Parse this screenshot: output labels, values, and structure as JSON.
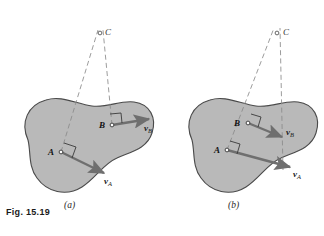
{
  "figure": {
    "caption": "Fig. 15.19",
    "panels": [
      {
        "id": "a",
        "sublabel": "(a)",
        "instant_center_label": "C",
        "points": [
          {
            "label": "A",
            "x": 61,
            "y": 152
          },
          {
            "label": "B",
            "x": 112,
            "y": 125
          },
          {
            "label": "C",
            "x": 100,
            "y": 33
          }
        ],
        "vectors": [
          {
            "name": "v_A",
            "label_v": "v",
            "label_sub": "A",
            "from": [
              61,
              152
            ],
            "to": [
              106,
              174
            ]
          },
          {
            "name": "v_B",
            "label_v": "v",
            "label_sub": "B",
            "from": [
              112,
              125
            ],
            "to": [
              152,
              118
            ]
          }
        ]
      },
      {
        "id": "b",
        "sublabel": "(b)",
        "instant_center_label": "C",
        "points": [
          {
            "label": "A",
            "x": 227,
            "y": 150
          },
          {
            "label": "B",
            "x": 248,
            "y": 123
          },
          {
            "label": "C",
            "x": 277,
            "y": 33
          }
        ],
        "vectors": [
          {
            "name": "v_A",
            "label_v": "v",
            "label_sub": "A",
            "from": [
              227,
              150
            ],
            "to": [
              292,
              168
            ]
          },
          {
            "name": "v_B",
            "label_v": "v",
            "label_sub": "B",
            "from": [
              248,
              123
            ],
            "to": [
              284,
              138
            ]
          }
        ]
      }
    ],
    "colors": {
      "body_fill": "#b9b9b9",
      "body_stroke": "#4a4a4a",
      "vector": "#6f6f6f",
      "dashed_line": "#8a8a8a",
      "text": "#1a1a1a",
      "background": "#ffffff"
    }
  }
}
